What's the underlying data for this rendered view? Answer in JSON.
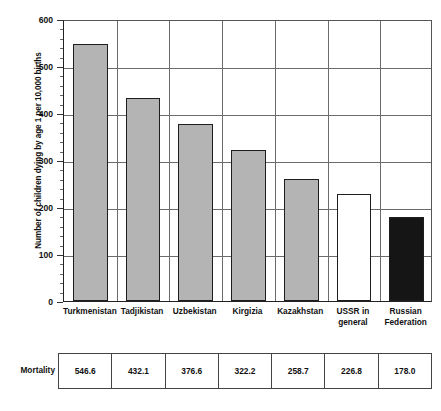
{
  "chart_data": {
    "type": "bar",
    "title": "",
    "subtitle": "",
    "xlabel": "",
    "ylabel": "Number of children dying by age 1 per 10,000 births",
    "ylim": [
      0,
      600
    ],
    "ytick_labels": [
      "0",
      "100",
      "200",
      "300",
      "400",
      "500",
      "600"
    ],
    "ytick_values": [
      0,
      100,
      200,
      300,
      400,
      500,
      600
    ],
    "minor_tick_step": 20,
    "grid": "horizontal-and-vertical",
    "legend": "none",
    "categories": [
      "Turkmenistan",
      "Tadjikistan",
      "Uzbekistan",
      "Kirgizia",
      "Kazakhstan",
      "USSR in general",
      "Russian Federation"
    ],
    "category_lines": [
      [
        "Turkmenistan"
      ],
      [
        "Tadjikistan"
      ],
      [
        "Uzbekistan"
      ],
      [
        "Kirgizia"
      ],
      [
        "Kazakhstan"
      ],
      [
        "USSR in",
        "general"
      ],
      [
        "Russian",
        "Federation"
      ]
    ],
    "values": [
      546.6,
      432.1,
      376.6,
      322.2,
      258.7,
      226.8,
      178.0
    ],
    "bar_styles": [
      "grey",
      "grey",
      "grey",
      "grey",
      "grey",
      "white",
      "black"
    ],
    "colors": {
      "grey": "#b4b4b4",
      "white": "#ffffff",
      "black": "#151515",
      "bar_outline": "#1e1e1e",
      "gridline": "#6b6b6b",
      "axis": "#222222"
    }
  },
  "table": {
    "row_label": "Mortality",
    "values": [
      "546.6",
      "432.1",
      "376.6",
      "322.2",
      "258.7",
      "226.8",
      "178.0"
    ]
  }
}
